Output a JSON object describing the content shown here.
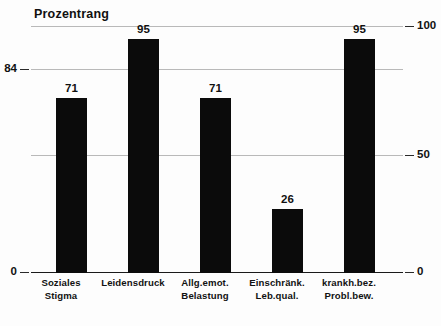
{
  "chart_data": {
    "type": "bar",
    "title": "Prozentrang",
    "xlabel": "",
    "ylabel": "Prozentrang",
    "categories": [
      "Soziales Stigma",
      "Leidensdruck",
      "Allg.emot. Belastung",
      "Einschränk. Leb.qual.",
      "krankh.bez. Probl.bew."
    ],
    "category_lines": [
      [
        "Soziales",
        "Stigma"
      ],
      [
        "Leidensdruck",
        ""
      ],
      [
        "Allg.emot.",
        "Belastung"
      ],
      [
        "Einschränk.",
        "Leb.qual."
      ],
      [
        "krankh.bez.",
        "Probl.bew."
      ]
    ],
    "values": [
      71,
      95,
      71,
      26,
      95
    ],
    "value_labels": [
      "71",
      "95",
      "71",
      "26",
      "95"
    ],
    "ylim": [
      0,
      100
    ],
    "grid": true,
    "legend": "none",
    "bar_color": "#0b0b0b",
    "gridline_color": "#b9b9b9",
    "axis_color": "#1a1a1a",
    "axis_left": {
      "ticks": [
        {
          "value": 84,
          "label": "84"
        },
        {
          "value": 0,
          "label": "0"
        }
      ]
    },
    "axis_right": {
      "ticks": [
        {
          "value": 100,
          "label": "100"
        },
        {
          "value": 50,
          "label": "50"
        },
        {
          "value": 0,
          "label": "0"
        }
      ]
    },
    "gridlines": [
      100,
      84,
      50,
      0
    ]
  }
}
